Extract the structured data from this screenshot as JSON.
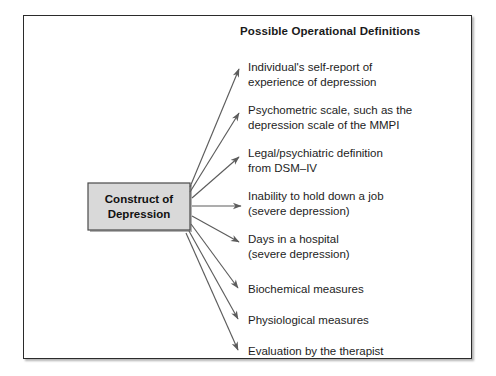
{
  "figure": {
    "type": "concept-map",
    "heading": "Possible Operational Definitions",
    "construct": {
      "line1": "Construct of",
      "line2": "Depression",
      "fill_color": "#d9d9d9",
      "border_color": "#4a4a4a"
    },
    "frame_color": "#2b2b2b",
    "arrow_color": "#5c5c5c",
    "definitions": [
      {
        "id": "self-report",
        "line1": "Individual's self-report of",
        "line2": "experience of depression",
        "top": 60
      },
      {
        "id": "psychometric-scale",
        "line1": "Psychometric scale, such as the",
        "line2": "depression scale of the MMPI",
        "top": 103
      },
      {
        "id": "legal-psychiatric",
        "line1": "Legal/psychiatric definition",
        "line2": "from DSM–IV",
        "top": 146
      },
      {
        "id": "inability-to-work",
        "line1": "Inability to hold down a job",
        "line2": "(severe depression)",
        "top": 189
      },
      {
        "id": "days-in-hospital",
        "line1": "Days in a hospital",
        "line2": "(severe depression)",
        "top": 232
      },
      {
        "id": "biochemical-measures",
        "line1": "Biochemical measures",
        "line2": "",
        "top": 282
      },
      {
        "id": "physiological-measures",
        "line1": "Physiological measures",
        "line2": "",
        "top": 313
      },
      {
        "id": "therapist-evaluation",
        "line1": "Evaluation by the therapist",
        "line2": "",
        "top": 344
      }
    ]
  }
}
